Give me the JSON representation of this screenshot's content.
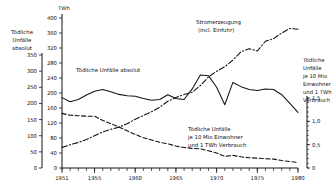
{
  "chart_data": {
    "type": "line",
    "title": "",
    "xlabel": "",
    "ylabel": "TWh",
    "unit_top_left": "TWh",
    "xlim": [
      1951,
      1980
    ],
    "ylim": [
      0,
      400
    ],
    "grid": false,
    "legend": "inline-annotations",
    "x_ticks": [
      "1951",
      "1955",
      "1960",
      "1965",
      "1970",
      "1975",
      "1980"
    ],
    "x_minor_tick_interval": 1,
    "primary_axis": {
      "name": "left-main-twh",
      "label": "TWh",
      "ticks": [
        "0",
        "40",
        "80",
        "120",
        "160",
        "200",
        "240",
        "280",
        "320",
        "360",
        "400"
      ],
      "range": [
        0,
        400
      ]
    },
    "secondary_left_axis": {
      "name": "left-outer-absolute-fatalities",
      "title_lines": [
        "Tödliche",
        "Unfälle",
        "absolut"
      ],
      "ticks": [
        "0",
        "50",
        "100",
        "150",
        "200",
        "250",
        "300",
        "350"
      ],
      "range": [
        0,
        350
      ]
    },
    "secondary_right_axis": {
      "name": "right-rate-axis",
      "title_lines": [
        "Tödliche",
        "Unfälle",
        "je 10 Mio",
        "Einwohner",
        "und 1 TWh",
        "Verbrauch"
      ],
      "ticks": [
        "0",
        "0,5",
        "1,0",
        "1,5"
      ],
      "range": [
        0,
        1.5
      ]
    },
    "series": [
      {
        "name": "toedliche-unfaelle-absolut",
        "label": "Tödliche Unfälle absolut",
        "style": "solid",
        "axis": "secondary_left_axis",
        "x": [
          1951,
          1952,
          1953,
          1954,
          1955,
          1956,
          1957,
          1958,
          1959,
          1960,
          1961,
          1962,
          1963,
          1964,
          1965,
          1966,
          1967,
          1968,
          1969,
          1970,
          1971,
          1972,
          1973,
          1974,
          1975,
          1976,
          1977,
          1978,
          1979,
          1980
        ],
        "values": [
          218,
          205,
          212,
          226,
          238,
          243,
          236,
          228,
          224,
          222,
          215,
          210,
          212,
          227,
          215,
          212,
          245,
          288,
          286,
          250,
          196,
          265,
          252,
          243,
          240,
          245,
          243,
          227,
          200,
          172
        ]
      },
      {
        "name": "stromerzeugung-incl-einfuhr",
        "label": "Stromerzeugung (incl. Einfuhr)",
        "style": "dash-dot",
        "axis": "primary_axis",
        "x": [
          1951,
          1952,
          1953,
          1954,
          1955,
          1956,
          1957,
          1958,
          1959,
          1960,
          1961,
          1962,
          1963,
          1964,
          1965,
          1966,
          1967,
          1968,
          1969,
          1970,
          1971,
          1972,
          1973,
          1974,
          1975,
          1976,
          1977,
          1978,
          1979,
          1980
        ],
        "values": [
          55,
          62,
          68,
          76,
          86,
          96,
          103,
          109,
          118,
          130,
          140,
          150,
          162,
          178,
          188,
          196,
          202,
          220,
          243,
          258,
          270,
          288,
          310,
          318,
          312,
          338,
          345,
          360,
          372,
          370
        ]
      },
      {
        "name": "unfaelle-je-10mio-einwohner-und-twh",
        "label": "Tödliche Unfälle je 10 Mio Einwohner und 1 TWh Verbrauch",
        "style": "dashed",
        "axis": "secondary_right_axis",
        "x": [
          1951,
          1952,
          1953,
          1954,
          1955,
          1956,
          1957,
          1958,
          1959,
          1960,
          1961,
          1962,
          1963,
          1964,
          1965,
          1966,
          1967,
          1968,
          1969,
          1970,
          1971,
          1972,
          1973,
          1974,
          1975,
          1976,
          1977,
          1978,
          1979,
          1980
        ],
        "values": [
          1.17,
          1.13,
          1.12,
          1.11,
          1.11,
          1.02,
          0.95,
          0.88,
          0.8,
          0.72,
          0.65,
          0.6,
          0.55,
          0.52,
          0.47,
          0.44,
          0.42,
          0.41,
          0.37,
          0.32,
          0.25,
          0.27,
          0.24,
          0.22,
          0.21,
          0.2,
          0.19,
          0.16,
          0.14,
          0.12
        ]
      }
    ],
    "annotations": [
      {
        "name": "annotation-absolut",
        "text": "Tödliche Unfälle absolut",
        "x": 76,
        "y": 72
      },
      {
        "name": "annotation-stromerzeugung-line1",
        "text": "Stromerzeugung",
        "x": 196,
        "y": 24
      },
      {
        "name": "annotation-stromerzeugung-line2",
        "text": "(incl. Einfuhr)",
        "x": 198,
        "y": 32
      },
      {
        "name": "annotation-rate-line1",
        "text": "Tödliche Unfälle",
        "x": 188,
        "y": 131
      },
      {
        "name": "annotation-rate-line2",
        "text": "je 10 Mio Einwohner",
        "x": 188,
        "y": 139
      },
      {
        "name": "annotation-rate-line3",
        "text": "und 1 TWh Verbrauch",
        "x": 188,
        "y": 147
      }
    ]
  }
}
